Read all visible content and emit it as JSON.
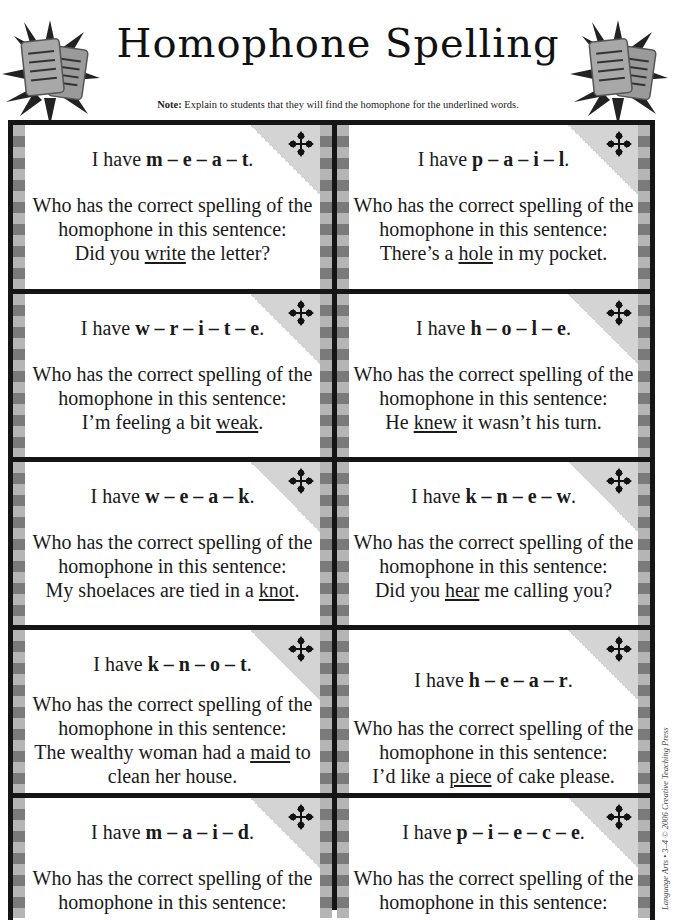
{
  "header": {
    "title": "Homophone Spelling",
    "note_label": "Note:",
    "note_text": " Explain to students that they will find the homophone for the underlined words.",
    "decoration_icon": "papers-starburst-icon"
  },
  "card_common": {
    "prefix": "I have ",
    "question_line1": "Who has the correct spelling of the",
    "question_line2": "homophone in this sentence:",
    "corner_icon": "move-arrows-icon"
  },
  "cards": [
    {
      "have_word": "m – e – a – t",
      "have_end": ".",
      "sentence_before": "Did you ",
      "underlined": "write",
      "sentence_after": " the letter?"
    },
    {
      "have_word": "p – a – i – l",
      "have_end": ".",
      "sentence_before": "There’s a ",
      "underlined": "hole",
      "sentence_after": " in my pocket."
    },
    {
      "have_word": "w – r – i – t – e",
      "have_end": ".",
      "sentence_before": "I’m feeling a bit ",
      "underlined": "weak",
      "sentence_after": "."
    },
    {
      "have_word": "h – o – l – e",
      "have_end": ".",
      "sentence_before": "He ",
      "underlined": "knew",
      "sentence_after": " it wasn’t his turn."
    },
    {
      "have_word": "w – e – a – k",
      "have_end": ".",
      "sentence_before": "My shoelaces are tied in a ",
      "underlined": "knot",
      "sentence_after": "."
    },
    {
      "have_word": "k – n – e – w",
      "have_end": ".",
      "sentence_before": "Did you ",
      "underlined": "hear",
      "sentence_after": " me calling you?"
    },
    {
      "have_word": "k – n – o – t",
      "have_end": ".",
      "sentence_before": "The wealthy woman had a ",
      "underlined": "maid",
      "sentence_after": " to",
      "sentence_line2": "clean her house."
    },
    {
      "have_word": "h – e – a – r",
      "have_end": ".",
      "sentence_before": "I’d like a ",
      "underlined": "piece",
      "sentence_after": " of cake please."
    },
    {
      "have_word": "m – a – i – d",
      "have_end": ".",
      "sentence_before": "",
      "underlined": "",
      "sentence_after": ""
    },
    {
      "have_word": "p – i – e – c – e",
      "have_end": ".",
      "sentence_before": "",
      "underlined": "",
      "sentence_after": ""
    }
  ],
  "footer": {
    "copyright": "Language Arts • 3–4 © 2006 Creative Teaching Press"
  },
  "colors": {
    "border": "#151515",
    "stripe_light": "#b5b5b5",
    "stripe_dark": "#7a7a7a",
    "corner_shade": "#d4d4d4"
  }
}
